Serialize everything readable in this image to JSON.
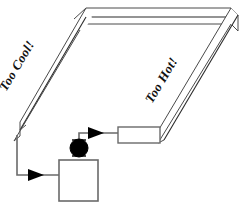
{
  "diagram": {
    "labels": {
      "left_leg": "Too Cool!",
      "right_leg": "Too Hot!"
    },
    "colors": {
      "background": "#ffffff",
      "duct_edge": "#4a4a4a",
      "duct_edge_dark": "#2b2b2b",
      "pipe": "#6a6a6a",
      "arrow": "#000000",
      "pump": "#000000",
      "text": "#111111"
    },
    "components": [
      {
        "name": "duct-loop",
        "type": "3d-channel",
        "shape": "u-shaped-open-channel"
      },
      {
        "name": "left-leg-duct",
        "type": "channel-leg",
        "label": "Too Cool!"
      },
      {
        "name": "right-leg-duct",
        "type": "channel-leg",
        "label": "Too Hot!"
      },
      {
        "name": "top-duct",
        "type": "channel-leg",
        "label": ""
      },
      {
        "name": "heat-exchanger",
        "type": "rectangle"
      },
      {
        "name": "tank",
        "type": "rectangle"
      },
      {
        "name": "pump",
        "type": "filled-circle"
      },
      {
        "name": "return-pipe",
        "type": "polyline"
      },
      {
        "name": "supply-pipe",
        "type": "polyline"
      },
      {
        "name": "flow-arrow-inlet",
        "type": "arrow",
        "direction": "right"
      },
      {
        "name": "flow-arrow-outlet",
        "type": "arrow",
        "direction": "right"
      }
    ]
  }
}
